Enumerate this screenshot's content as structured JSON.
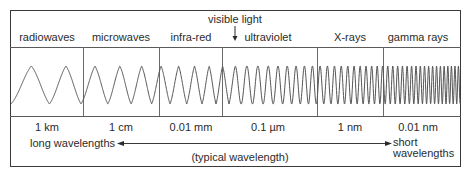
{
  "diagram": {
    "annotation": "visible light",
    "bands": [
      {
        "name": "radiowaves",
        "wavelength": "1 km"
      },
      {
        "name": "microwaves",
        "wavelength": "1 cm"
      },
      {
        "name": "infra-red",
        "wavelength": "0.01 mm"
      },
      {
        "name": "ultraviolet",
        "wavelength": "0.1 µm"
      },
      {
        "name": "X-rays",
        "wavelength": "1 nm"
      },
      {
        "name": "gamma rays",
        "wavelength": "0.01 nm"
      }
    ],
    "axis": {
      "left_label": "long wavelengths",
      "middle_label": "(typical wavelength)",
      "right_label_line1": "short",
      "right_label_line2": "wavelengths"
    },
    "colors": {
      "line": "#3a3a3a",
      "wave": "#555555",
      "text": "#2b2b2b",
      "background": "#ffffff"
    }
  }
}
